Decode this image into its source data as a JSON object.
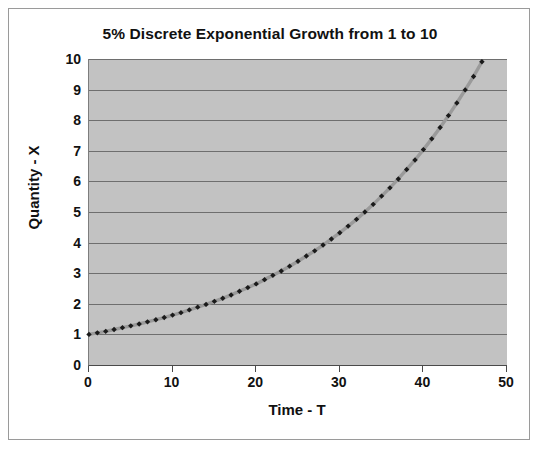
{
  "chart_data": {
    "type": "line",
    "title": "5% Discrete Exponential Growth from 1 to 10",
    "xlabel": "Time - T",
    "ylabel": "Quantity - X",
    "xlim": [
      0,
      50
    ],
    "ylim": [
      0,
      10
    ],
    "xticks": [
      0,
      10,
      20,
      30,
      40,
      50
    ],
    "yticks": [
      0,
      1,
      2,
      3,
      4,
      5,
      6,
      7,
      8,
      9,
      10
    ],
    "xtick_labels": [
      "0",
      "10",
      "20",
      "30",
      "40",
      "50"
    ],
    "ytick_labels": [
      "0",
      "1",
      "2",
      "3",
      "4",
      "5",
      "6",
      "7",
      "8",
      "9",
      "10"
    ],
    "grid": "horizontal",
    "legend": "none",
    "plot_background": "#c2c2c2",
    "line_color": "#9a9a9a",
    "marker_color": "#1a1a1a",
    "marker_shape": "diamond",
    "series": [
      {
        "name": "Quantity - X",
        "x": [
          0,
          1,
          2,
          3,
          4,
          5,
          6,
          7,
          8,
          9,
          10,
          11,
          12,
          13,
          14,
          15,
          16,
          17,
          18,
          19,
          20,
          21,
          22,
          23,
          24,
          25,
          26,
          27,
          28,
          29,
          30,
          31,
          32,
          33,
          34,
          35,
          36,
          37,
          38,
          39,
          40,
          41,
          42,
          43,
          44,
          45,
          46,
          47
        ],
        "values": [
          1.0,
          1.05,
          1.1,
          1.16,
          1.22,
          1.28,
          1.34,
          1.41,
          1.48,
          1.55,
          1.63,
          1.71,
          1.8,
          1.89,
          1.98,
          2.08,
          2.18,
          2.29,
          2.41,
          2.53,
          2.65,
          2.79,
          2.93,
          3.07,
          3.23,
          3.39,
          3.56,
          3.73,
          3.92,
          4.12,
          4.32,
          4.54,
          4.76,
          5.0,
          5.25,
          5.52,
          5.79,
          6.08,
          6.39,
          6.7,
          7.04,
          7.39,
          7.76,
          8.15,
          8.56,
          8.99,
          9.43,
          9.91
        ]
      }
    ]
  }
}
